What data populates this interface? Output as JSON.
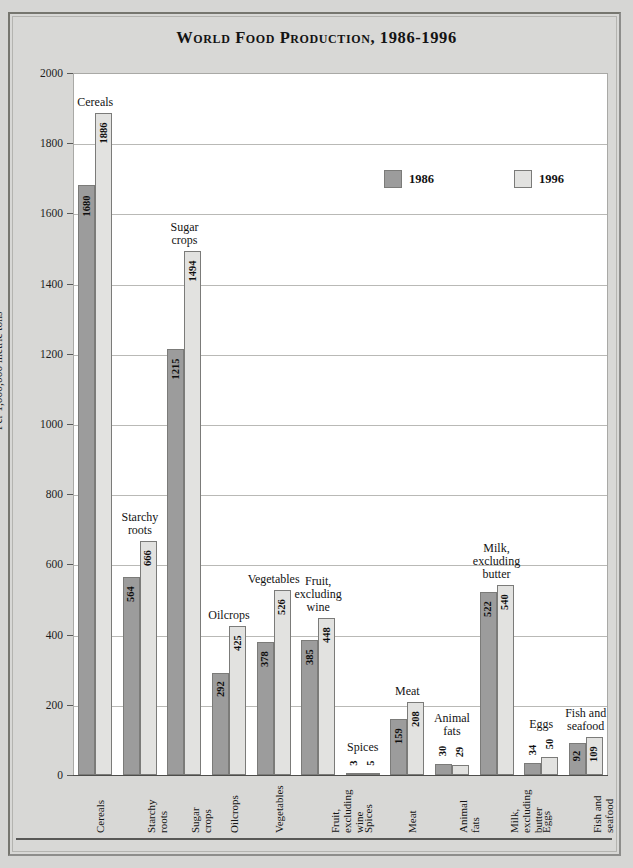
{
  "chart_data": {
    "type": "bar",
    "title": "World Food Production, 1986-1996",
    "xlabel": "",
    "ylabel": "Per 1,000,000 metric tons",
    "ylim": [
      0,
      2000
    ],
    "ytick_step": 200,
    "yticks": [
      "2000",
      "1800",
      "1600",
      "1400",
      "1200",
      "1000",
      "800",
      "600",
      "400",
      "200",
      "0"
    ],
    "grid": true,
    "legend_position": "inside-upper-right",
    "categories": [
      "Cereals",
      "Starchy roots",
      "Sugar crops",
      "Oilcrops",
      "Vegetables",
      "Fruit, excluding wine",
      "Spices",
      "Meat",
      "Animal fats",
      "Milk, excluding butter",
      "Eggs",
      "Fish and seafood"
    ],
    "category_labels_multiline": [
      "Cereals",
      "Starchy\nroots",
      "Sugar\ncrops",
      "Oilcrops",
      "Vegetables",
      "Fruit,\nexcluding\nwine",
      "Spices",
      "Meat",
      "Animal\nfats",
      "Milk,\nexcluding\nbutter",
      "Eggs",
      "Fish and\nseafood"
    ],
    "series": [
      {
        "name": "1986",
        "color": "#9c9c9c",
        "values": [
          1680,
          564,
          1215,
          292,
          378,
          385,
          3,
          159,
          30,
          522,
          34,
          92
        ]
      },
      {
        "name": "1996",
        "color": "#e2e2e0",
        "values": [
          1886,
          666,
          1494,
          425,
          526,
          448,
          5,
          208,
          29,
          540,
          50,
          109
        ]
      }
    ],
    "legend": [
      {
        "label": "1986",
        "swatch": "#9c9c9c"
      },
      {
        "label": "1996",
        "swatch": "#e2e2e0"
      }
    ]
  },
  "colors": {
    "page_background": "#d6d6d4",
    "plot_background": "#ffffff",
    "gridline": "#b9b9b6",
    "series_1986": "#9c9c9c",
    "series_1996": "#e2e2e0",
    "text": "#131313"
  }
}
